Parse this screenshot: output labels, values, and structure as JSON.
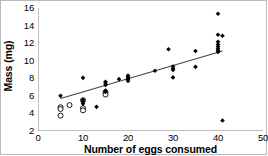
{
  "chart_data": {
    "type": "scatter",
    "title": "",
    "xlabel": "Number of eggs consumed",
    "ylabel": "Mass (mg)",
    "xlim": [
      0,
      50
    ],
    "ylim": [
      2,
      16
    ],
    "xticks": [
      0,
      10,
      20,
      30,
      40,
      50
    ],
    "yticks": [
      2,
      4,
      6,
      8,
      10,
      12,
      14,
      16
    ],
    "grid": false,
    "legend": "none",
    "series": [
      {
        "name": "filled-diamond-points",
        "marker": "filled-diamond",
        "color": "#000000",
        "points": [
          [
            5,
            6.0
          ],
          [
            10,
            8.05
          ],
          [
            10,
            5.55
          ],
          [
            10,
            5.35
          ],
          [
            10,
            5.1
          ],
          [
            13,
            4.75
          ],
          [
            15,
            7.6
          ],
          [
            15,
            7.45
          ],
          [
            15,
            7.25
          ],
          [
            15,
            6.6
          ],
          [
            15,
            6.45
          ],
          [
            18,
            7.9
          ],
          [
            20,
            8.3
          ],
          [
            20,
            8.15
          ],
          [
            20,
            8.0
          ],
          [
            20,
            7.85
          ],
          [
            20,
            7.7
          ],
          [
            26,
            8.85
          ],
          [
            29,
            11.3
          ],
          [
            30,
            9.35
          ],
          [
            30,
            9.1
          ],
          [
            30,
            8.95
          ],
          [
            30,
            8.1
          ],
          [
            35,
            11.1
          ],
          [
            35,
            9.3
          ],
          [
            40,
            15.35
          ],
          [
            40,
            12.95
          ],
          [
            41,
            12.85
          ],
          [
            40,
            12.15
          ],
          [
            40,
            11.85
          ],
          [
            40,
            11.6
          ],
          [
            40,
            11.35
          ],
          [
            40,
            11.15
          ],
          [
            40,
            11.0
          ],
          [
            41,
            3.2
          ]
        ]
      },
      {
        "name": "open-circle-points",
        "marker": "open-circle",
        "color": "#000000",
        "points": [
          [
            5,
            4.7
          ],
          [
            5,
            4.5
          ],
          [
            5,
            3.75
          ],
          [
            7,
            4.95
          ],
          [
            10,
            5.5
          ],
          [
            10,
            4.6
          ],
          [
            10,
            4.35
          ],
          [
            15,
            6.4
          ],
          [
            15,
            6.15
          ]
        ]
      }
    ],
    "trendline": {
      "name": "linear-fit-line",
      "x_start": 5,
      "y_start": 5.7,
      "x_end": 41,
      "y_end": 11.1,
      "color": "#444444"
    }
  },
  "axes": {
    "y_tick_labels": [
      "16",
      "14",
      "12",
      "10",
      "8",
      "6",
      "4",
      "2"
    ],
    "x_tick_labels": [
      "0",
      "10",
      "20",
      "30",
      "40",
      "50"
    ],
    "x_title": "Number of eggs consumed",
    "y_title": "Mass (mg)"
  }
}
